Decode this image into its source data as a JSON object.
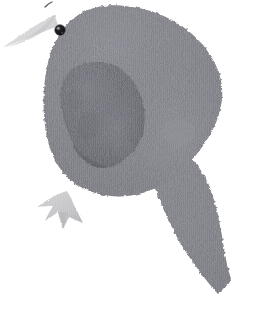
{
  "artwork": {
    "title": "Bird",
    "subject": "songbird-side-profile",
    "medium": "torn-paper-collage",
    "canvas": {
      "width": 269,
      "height": 319,
      "background": "#ffffff"
    },
    "alt_text": "A gray torn-paper collage of a small bird facing left, with a pale triangular beak, a dark round eye, a darker leaf-shaped wing, one pale clawed foot, and a long tail sweeping down to the lower right."
  },
  "palette": {
    "background": "#ffffff",
    "body_gray": "#83838a",
    "body_gray_light": "#8d8d94",
    "body_gray_dark": "#75757c",
    "wing_gray": "#6f6f77",
    "wing_gray_light": "#7c7c84",
    "wing_edge": "#5f5f67",
    "beak_gray": "#d5d5d6",
    "beak_shadow": "#c2c2c4",
    "foot_gray": "#c6c6c8",
    "foot_shadow": "#b4b4b7",
    "eye_black": "#1b1b1e",
    "eye_highlight": "#9a9a9e",
    "hair_mark": "#3d3d42"
  },
  "parts": [
    {
      "id": "body",
      "label": "Body",
      "color": "#83838a"
    },
    {
      "id": "head",
      "label": "Head",
      "color": "#83838a"
    },
    {
      "id": "beak",
      "label": "Beak",
      "color": "#d5d5d6"
    },
    {
      "id": "eye",
      "label": "Eye",
      "color": "#1b1b1e"
    },
    {
      "id": "wing",
      "label": "Wing",
      "color": "#6f6f77"
    },
    {
      "id": "foot",
      "label": "Foot",
      "color": "#c6c6c8"
    },
    {
      "id": "tail",
      "label": "Tail",
      "color": "#83838a"
    },
    {
      "id": "crest",
      "label": "Head tuft mark",
      "color": "#3d3d42"
    }
  ],
  "geometry": {
    "body_path": "M 96 8 C 80 12, 66 22, 58 36 C 50 50, 46 66, 44 84 C 42 102, 42 120, 45 138 C 48 156, 55 172, 68 183 C 80 193, 96 197, 112 196 C 128 195, 143 190, 156 182 C 170 173, 182 161, 192 148 C 200 137, 206 126, 212 114 C 216 106, 219 98, 220 90 C 221 78, 218 66, 212 55 C 204 41, 192 29, 177 21 C 162 13, 145 8, 128 6 C 117 5, 106 6, 96 8 Z",
    "tail_path": "M 185 155 C 193 162, 200 170, 205 179 C 211 190, 214 202, 217 214 C 220 228, 222 242, 224 254 C 226 264, 228 272, 230 278 C 226 284, 222 289, 218 293 C 212 287, 206 280, 200 272 C 192 262, 185 251, 179 240 C 172 227, 166 214, 161 202 C 157 192, 154 183, 152 175 C 158 170, 166 165, 174 160 C 178 158, 182 156, 185 155 Z",
    "beak_path": "M 58 26 C 48 30, 38 34, 28 38 C 20 41, 12 44, 3 47 C 12 41, 21 35, 30 29 C 38 24, 46 19, 54 15 C 56 18, 57 22, 58 26 Z",
    "wing_path": "M 80 66 C 92 62, 104 62, 114 67 C 125 72, 133 81, 138 93 C 143 105, 144 118, 141 131 C 138 143, 131 153, 121 160 C 112 166, 102 168, 94 165 C 86 162, 80 155, 75 146 C 69 135, 65 122, 63 109 C 61 96, 62 84, 67 76 C 70 71, 75 68, 80 66 Z",
    "foot_path": "M 66 192 C 69 196, 71 200, 73 204 C 76 210, 79 216, 82 222 C 77 220, 72 218, 68 216 C 66 220, 64 224, 62 228 C 60 222, 58 216, 57 211 C 53 214, 48 217, 44 220 C 46 215, 49 210, 52 205 C 47 205, 42 205, 37 206 C 43 202, 50 198, 57 195 C 60 194, 63 193, 66 192 Z",
    "eye": {
      "cx": 60,
      "cy": 30,
      "r": 5.2
    },
    "crest": {
      "x": 48,
      "y": 3,
      "length": 7
    }
  },
  "texture": {
    "stripe_color": "#ffffff",
    "stripe_opacity": 0.07,
    "stripe_spacing_px": 2,
    "note": "vertical corrugated paper striping across all collage pieces"
  }
}
